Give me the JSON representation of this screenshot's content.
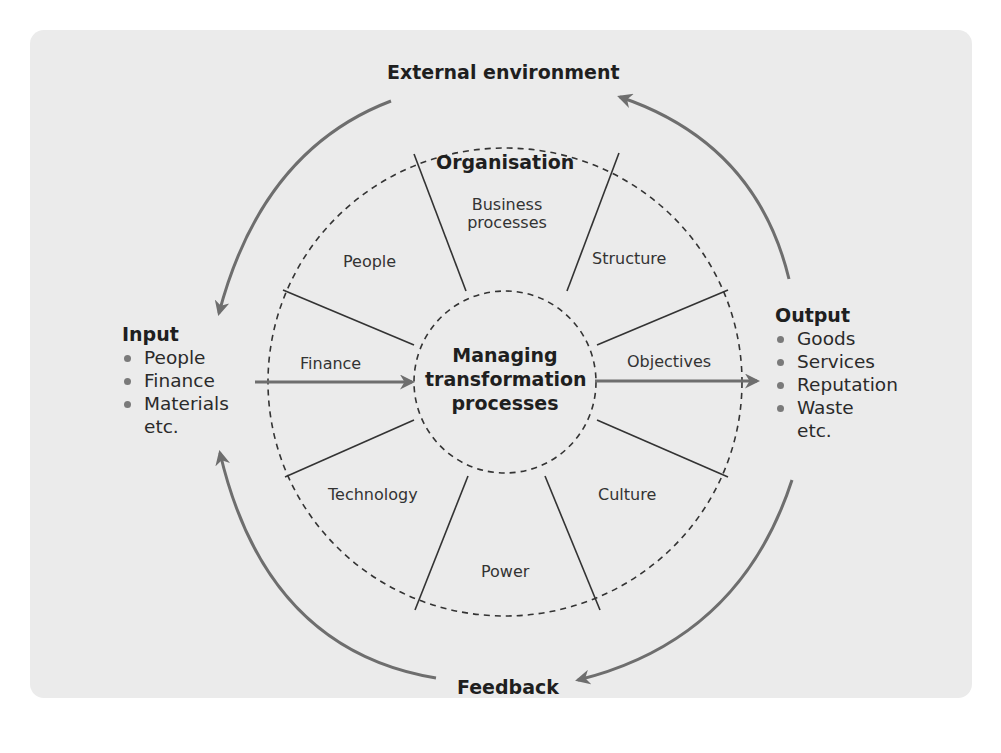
{
  "diagram": {
    "title": "External environment",
    "feedback_label": "Feedback",
    "center": {
      "line1": "Managing",
      "line2": "transformation",
      "line3": "processes"
    },
    "organisation_label": "Organisation",
    "segments": [
      {
        "id": "business-processes",
        "line1": "Business",
        "line2": "processes"
      },
      {
        "id": "structure",
        "label": "Structure"
      },
      {
        "id": "objectives",
        "label": "Objectives"
      },
      {
        "id": "culture",
        "label": "Culture"
      },
      {
        "id": "power",
        "label": "Power"
      },
      {
        "id": "technology",
        "label": "Technology"
      },
      {
        "id": "finance",
        "label": "Finance"
      },
      {
        "id": "people",
        "label": "People"
      }
    ],
    "input": {
      "heading": "Input",
      "items": [
        "People",
        "Finance",
        "Materials"
      ],
      "more": "etc."
    },
    "output": {
      "heading": "Output",
      "items": [
        "Goods",
        "Services",
        "Reputation",
        "Waste"
      ],
      "more": "etc."
    },
    "colors": {
      "panel_bg": "#ebebeb",
      "arrow": "#6e6e6e",
      "divider": "#333333",
      "dashed_circle": "#333333",
      "text": "#2a2a2a"
    }
  }
}
